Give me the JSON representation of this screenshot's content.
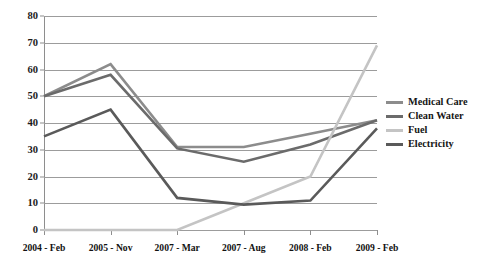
{
  "chart_data": {
    "type": "line",
    "title": "",
    "subtitle": "",
    "xlabel": "",
    "ylabel": "",
    "categories": [
      "2004 - Feb",
      "2005 - Nov",
      "2007 - Mar",
      "2007 - Aug",
      "2008 - Feb",
      "2009 - Feb"
    ],
    "ylim": [
      0,
      80
    ],
    "yticks": [
      0,
      10,
      20,
      30,
      40,
      50,
      60,
      70,
      80
    ],
    "ytick_labels": [
      "0",
      "10",
      "20",
      "30",
      "40",
      "50",
      "60",
      "70",
      "80"
    ],
    "grid": true,
    "grid_axis": "y",
    "legend_position": "right",
    "series": [
      {
        "name": "Medical Care",
        "color": "#8c8c8c",
        "values": [
          50,
          62,
          31,
          31,
          36,
          41
        ]
      },
      {
        "name": "Clean Water",
        "color": "#6b6b6b",
        "values": [
          50,
          58,
          30.5,
          25.5,
          32,
          41
        ]
      },
      {
        "name": "Fuel",
        "color": "#c4c4c4",
        "values": [
          0,
          0,
          0,
          10,
          20,
          69
        ]
      },
      {
        "name": "Electricity",
        "color": "#5a5a5a",
        "values": [
          35,
          45,
          12,
          9.5,
          11,
          38
        ]
      }
    ]
  },
  "legend": {
    "items": [
      {
        "label": "Medical Care"
      },
      {
        "label": "Clean Water"
      },
      {
        "label": "Fuel"
      },
      {
        "label": "Electricity"
      }
    ]
  }
}
